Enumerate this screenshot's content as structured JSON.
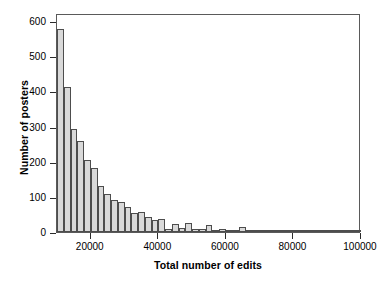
{
  "chart_data": {
    "type": "bar",
    "title": "",
    "subtitle": "",
    "xlabel": "Total number of edits",
    "ylabel": "Number of posters",
    "xlim": [
      10000,
      100000
    ],
    "ylim": [
      0,
      600
    ],
    "xticks": [
      20000,
      40000,
      60000,
      80000,
      100000
    ],
    "xtick_labels": [
      "20000",
      "40000",
      "60000",
      "80000",
      "100000"
    ],
    "yticks": [
      0,
      100,
      200,
      300,
      400,
      500,
      600
    ],
    "ytick_labels": [
      "0",
      "100",
      "200",
      "300",
      "400",
      "500",
      "600"
    ],
    "grid": false,
    "legend": false,
    "bin_width": 2000,
    "bin_starts": [
      10000,
      12000,
      14000,
      16000,
      18000,
      20000,
      22000,
      24000,
      26000,
      28000,
      30000,
      32000,
      34000,
      36000,
      38000,
      40000,
      42000,
      44000,
      46000,
      48000,
      50000,
      52000,
      54000,
      56000,
      58000,
      60000,
      62000,
      64000,
      66000,
      68000,
      70000,
      72000,
      74000,
      76000,
      78000,
      80000,
      82000,
      84000,
      86000,
      88000,
      90000,
      92000,
      94000,
      96000,
      98000
    ],
    "categories": [
      "10000",
      "12000",
      "14000",
      "16000",
      "18000",
      "20000",
      "22000",
      "24000",
      "26000",
      "28000",
      "30000",
      "32000",
      "34000",
      "36000",
      "38000",
      "40000",
      "42000",
      "44000",
      "46000",
      "48000",
      "50000",
      "52000",
      "54000",
      "56000",
      "58000",
      "60000",
      "62000",
      "64000",
      "66000",
      "68000",
      "70000",
      "72000",
      "74000",
      "76000",
      "78000",
      "80000",
      "82000",
      "84000",
      "86000",
      "88000",
      "90000",
      "92000",
      "94000",
      "96000",
      "98000"
    ],
    "values": [
      578,
      412,
      294,
      260,
      204,
      181,
      132,
      107,
      91,
      85,
      70,
      55,
      57,
      43,
      33,
      38,
      9,
      24,
      11,
      25,
      8,
      8,
      21,
      4,
      9,
      7,
      6,
      13,
      3,
      6,
      6,
      2,
      3,
      4,
      3,
      3,
      5,
      5,
      2,
      2,
      2,
      2,
      1,
      5,
      3
    ],
    "colors": {
      "bar_fill": "#d9d9d9",
      "bar_edge": "#4d4d4d",
      "axis": "#5a5a5a",
      "text": "#000000",
      "background": "#ffffff"
    }
  }
}
